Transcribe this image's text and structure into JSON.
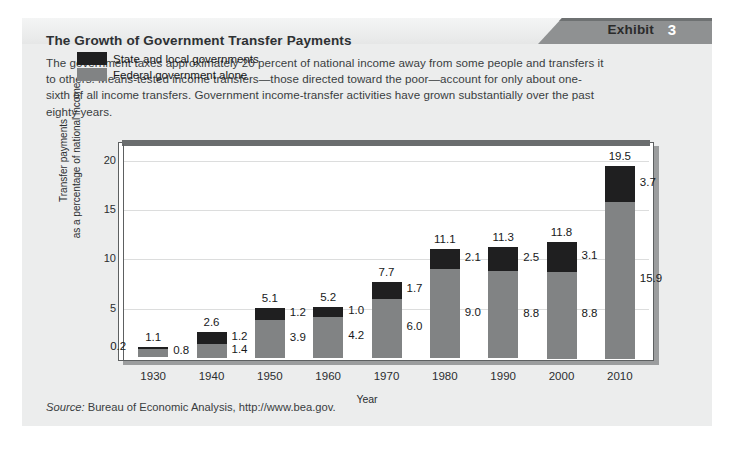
{
  "exhibit": {
    "badge_label": "Exhibit",
    "badge_number": "3",
    "title": "The Growth of Government Transfer Payments",
    "description": "The government taxes approximately 20 percent of national income away from some people and transfers it to others. Means-tested income transfers—those directed toward the poor—account for only about one-sixth of all income transfers. Government income-transfer activities have grown substantially over the past eighty years.",
    "source_prefix": "Source:",
    "source_text": "Bureau of Economic Analysis, http://www.bea.gov."
  },
  "colors": {
    "state_local": "#1f1f20",
    "federal": "#818384",
    "banner_dark": "#8f9192",
    "panel_bg": "#eceded",
    "gridline": "#dcdddd",
    "frame": "#5d6061"
  },
  "chart_data": {
    "type": "bar",
    "subtype": "stacked",
    "title": "The Growth of Government Transfer Payments",
    "xlabel": "Year",
    "ylabel": "Transfer payments\nas a percentage of national income",
    "ylabel_line1": "Transfer payments",
    "ylabel_line2": "as a percentage of national income",
    "categories": [
      "1930",
      "1940",
      "1950",
      "1960",
      "1970",
      "1980",
      "1990",
      "2000",
      "2010"
    ],
    "yticks": [
      "5",
      "10",
      "15",
      "20"
    ],
    "ytick_values": [
      5,
      10,
      15,
      20
    ],
    "ylim": [
      0,
      21.5
    ],
    "grid": true,
    "legend_position": "inside-top-left",
    "series": [
      {
        "name": "Federal government alone",
        "color": "#818384",
        "values": [
          0.8,
          1.4,
          3.9,
          4.2,
          6.0,
          9.0,
          8.8,
          8.8,
          15.9
        ]
      },
      {
        "name": "State and local governments",
        "color": "#1f1f20",
        "values": [
          0.2,
          1.2,
          1.2,
          1.0,
          1.7,
          2.1,
          2.5,
          3.1,
          3.7
        ]
      }
    ],
    "totals": [
      1.1,
      2.6,
      5.1,
      5.2,
      7.7,
      11.1,
      11.3,
      11.8,
      19.5
    ],
    "total_labels": [
      "1.1",
      "2.6",
      "5.1",
      "5.2",
      "7.7",
      "11.1",
      "11.3",
      "11.8",
      "19.5"
    ],
    "federal_labels": [
      "0.8",
      "1.4",
      "3.9",
      "4.2",
      "6.0",
      "9.0",
      "8.8",
      "8.8",
      "15.9"
    ],
    "state_labels": [
      "0.2",
      "1.2",
      "1.2",
      "1.0",
      "1.7",
      "2.1",
      "2.5",
      "3.1",
      "3.7"
    ]
  }
}
